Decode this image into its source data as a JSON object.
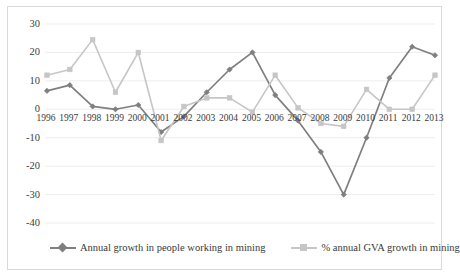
{
  "chart_data": {
    "type": "line",
    "title": "",
    "xlabel": "",
    "ylabel": "",
    "ylim": [
      -40,
      30
    ],
    "yticks": [
      30,
      20,
      10,
      0,
      -10,
      -20,
      -30,
      -40
    ],
    "grid": true,
    "legend_position": "bottom",
    "categories": [
      "1996",
      "1997",
      "1998",
      "1999",
      "2000",
      "2001",
      "2002",
      "2003",
      "2004",
      "2005",
      "2006",
      "2007",
      "2008",
      "2009",
      "2010",
      "2011",
      "2012",
      "2013"
    ],
    "series": [
      {
        "name": "Annual growth in people working in mining",
        "color": "#7f7f7f",
        "marker": "diamond",
        "values": [
          6.5,
          8.5,
          1.0,
          0.0,
          1.5,
          -8.0,
          -2.5,
          6.0,
          14.0,
          20.0,
          5.0,
          -4.0,
          -15.0,
          -30.0,
          -10.0,
          11.0,
          22.0,
          19.0
        ]
      },
      {
        "name": "% annual GVA growth in mining",
        "color": "#c6c6c6",
        "marker": "square",
        "values": [
          12.0,
          14.0,
          24.5,
          6.0,
          20.0,
          -11.0,
          1.0,
          4.0,
          4.0,
          -1.0,
          12.0,
          0.5,
          -5.0,
          -6.0,
          7.0,
          0.0,
          0.0,
          12.0
        ]
      }
    ]
  },
  "axis": {
    "ytick_labels": [
      "30",
      "20",
      "10",
      "0",
      "-10",
      "-20",
      "-30",
      "-40"
    ],
    "xtick_labels": [
      "1996",
      "1997",
      "1998",
      "1999",
      "2000",
      "2001",
      "2002",
      "2003",
      "2004",
      "2005",
      "2006",
      "2007",
      "2008",
      "2009",
      "2010",
      "2011",
      "2012",
      "2013"
    ]
  },
  "legend": {
    "items": [
      {
        "label": "Annual growth in people working in mining",
        "color": "#7f7f7f"
      },
      {
        "label": "% annual GVA growth in mining",
        "color": "#c6c6c6"
      }
    ]
  },
  "colors": {
    "series_dark": "#7f7f7f",
    "series_light": "#c6c6c6",
    "gridline": "#ededed",
    "frame": "#d9d9d9",
    "text": "#3a3a3a"
  }
}
